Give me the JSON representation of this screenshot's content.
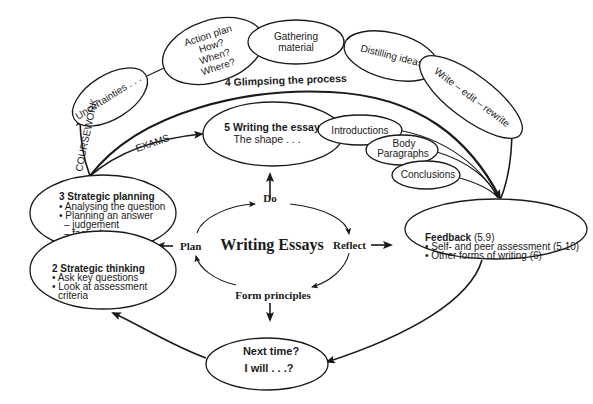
{
  "diagram": {
    "center": {
      "title": "Writing Essays",
      "do": "Do",
      "reflect": "Reflect",
      "form_principles": "Form principles",
      "plan": "Plan"
    },
    "coursework_label": "COURSEWORK",
    "exams_label": "EXAMS",
    "process_label": "4  Glimpsing the process",
    "process_steps": [
      {
        "lines": [
          "Uncertainties . . ."
        ]
      },
      {
        "lines": [
          "Action plan",
          "How?",
          "When?",
          "Where?"
        ]
      },
      {
        "lines": [
          "Gathering",
          "material"
        ]
      },
      {
        "lines": [
          "Distilling ideas"
        ]
      },
      {
        "lines": [
          "Write – edit – rewrite"
        ]
      }
    ],
    "writing_essay": {
      "title": "5 Writing the essay",
      "subtitle": "The shape . . ."
    },
    "essay_parts": [
      {
        "lines": [
          "Introductions"
        ]
      },
      {
        "lines": [
          "Body",
          "Paragraphs"
        ]
      },
      {
        "lines": [
          "Conclusions"
        ]
      }
    ],
    "strategic_planning": {
      "title": "3 Strategic planning",
      "items": [
        "• Analysing the question",
        "• Planning an answer",
        "– judgement",
        "– factual"
      ]
    },
    "strategic_thinking": {
      "title": "2 Strategic thinking",
      "items": [
        "• Ask key questions",
        "• Look at assessment",
        "criteria"
      ]
    },
    "feedback": {
      "title": "Feedback",
      "ref": "(5.9)",
      "items": [
        "• Self- and peer assessment (5.10)",
        "• Other forms of writing (6)"
      ]
    },
    "next_time": {
      "line1": "Next time?",
      "line2": "I will . . .?"
    }
  }
}
